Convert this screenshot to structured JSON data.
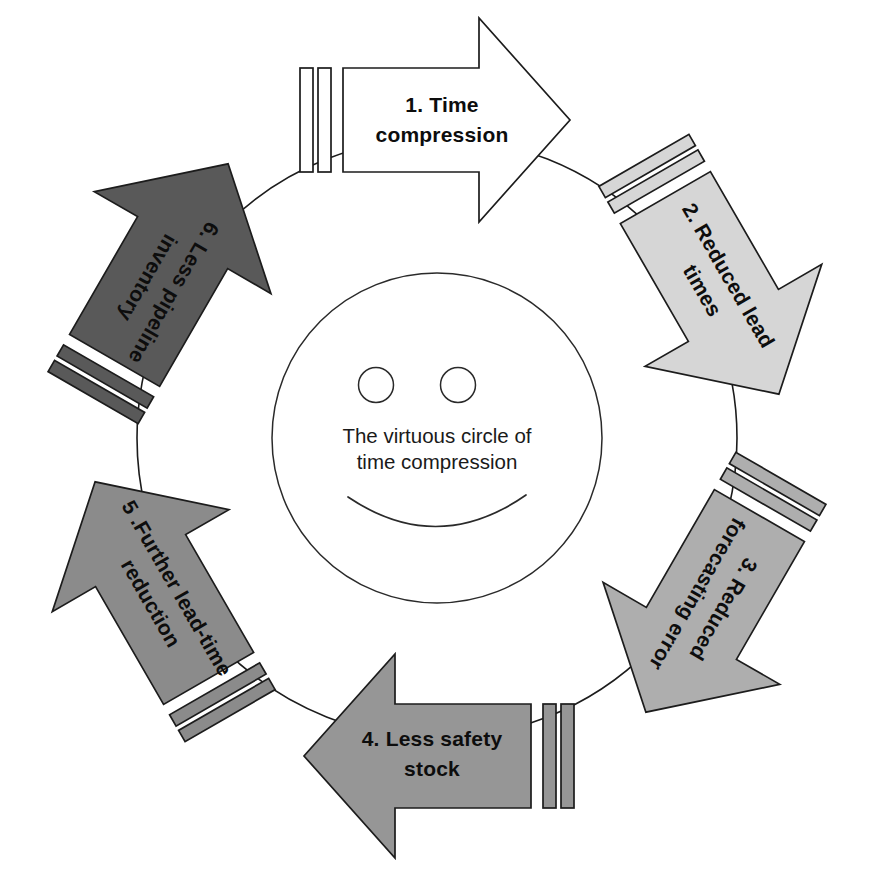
{
  "diagram": {
    "title": "The virtuous circle of time compression",
    "type": "cycle-diagram",
    "center": {
      "icon": "smiley-face-icon",
      "line1": "The virtuous circle of",
      "line2": "time compression"
    },
    "ring": {
      "cx": 437,
      "cy": 438,
      "r": 300,
      "stroke": "#1c1c1c"
    },
    "steps": [
      {
        "id": 1,
        "label_line1": "1. Time",
        "label_line2": "compression",
        "full_label": "1. Time compression",
        "fill": "#ffffff",
        "stroke": "#1c1c1c",
        "angle": 0,
        "position": "top",
        "direction": "right"
      },
      {
        "id": 2,
        "label_line1": "2. Reduced lead",
        "label_line2": "times",
        "full_label": "2. Reduced lead times",
        "fill": "#d6d6d6",
        "stroke": "#1c1c1c",
        "angle": 60,
        "position": "upper-right",
        "direction": "down-right"
      },
      {
        "id": 3,
        "label_line1": "3. Reduced",
        "label_line2": "forecasting error",
        "full_label": "3. Reduced forecasting error",
        "fill": "#aeaeae",
        "stroke": "#1c1c1c",
        "angle": 120,
        "position": "lower-right",
        "direction": "down-left"
      },
      {
        "id": 4,
        "label_line1": "4. Less safety",
        "label_line2": "stock",
        "full_label": "4. Less safety stock",
        "fill": "#969696",
        "stroke": "#1c1c1c",
        "angle": 180,
        "position": "bottom",
        "direction": "left"
      },
      {
        "id": 5,
        "label_line1": "5 .Further lead-time",
        "label_line2": "reduction",
        "full_label": "5 .Further lead-time reduction",
        "fill": "#8b8b8b",
        "stroke": "#1c1c1c",
        "angle": 240,
        "position": "lower-left",
        "direction": "up-left"
      },
      {
        "id": 6,
        "label_line1": "6. Less pipeline",
        "label_line2": "inventory",
        "full_label": "6. Less pipeline inventory",
        "fill": "#595959",
        "stroke": "#1c1c1c",
        "angle": 300,
        "position": "upper-left",
        "direction": "up-right"
      }
    ]
  }
}
